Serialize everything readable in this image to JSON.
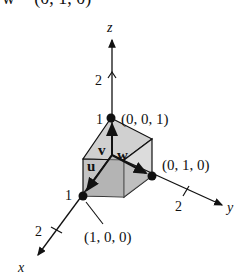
{
  "header_crop": {
    "text": "w = (0, 1, 0)"
  },
  "axes": {
    "z": {
      "label": "z",
      "tick2": "2",
      "tick1": "1"
    },
    "y": {
      "label": "y",
      "tick2": "2"
    },
    "x": {
      "label": "x",
      "tick2": "2",
      "tick1": "1"
    }
  },
  "points": {
    "e3": "(0, 0, 1)",
    "e2": "(0, 1, 0)",
    "e1": "(1, 0, 0)"
  },
  "vectors": {
    "u": "u",
    "v": "v",
    "w": "w"
  },
  "colors": {
    "cube_dark": "#a8a8a8",
    "cube_mid": "#c4c4c4",
    "cube_light": "#dcdcdc",
    "ink": "#111111"
  }
}
